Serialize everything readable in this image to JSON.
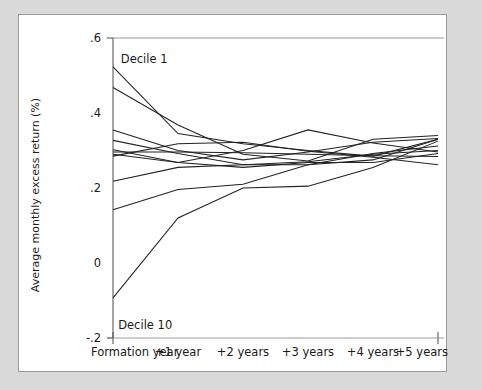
{
  "figure": {
    "background_color": "#d9d9d9",
    "panel_color": "#ffffff",
    "border_color": "#9a9a9a",
    "line_color": "#222222"
  },
  "chart_data": {
    "type": "line",
    "title": "",
    "subtitle": "",
    "xlabel": "",
    "ylabel": "Average monthly excess return (%)",
    "categories": [
      "Formation year",
      "+1 year",
      "+2 years",
      "+3 years",
      "+4 years",
      "+5 years"
    ],
    "x": [
      0,
      1,
      2,
      3,
      4,
      5
    ],
    "xlim": [
      0,
      5
    ],
    "ylim": [
      -0.2,
      0.6
    ],
    "yticks": [
      0.6,
      0.4,
      0.2,
      0,
      -0.2
    ],
    "ytick_labels": [
      ".6",
      ".4",
      ".2",
      "0",
      "-.2"
    ],
    "grid": false,
    "legend": "none",
    "annotations": [
      {
        "text": "Decile 1",
        "x": 0.12,
        "y": 0.545,
        "name": "decile-1-annotation"
      },
      {
        "text": "Decile 10",
        "x": 0.08,
        "y": -0.165,
        "name": "decile-10-annotation"
      }
    ],
    "series": [
      {
        "name": "Decile 1",
        "values": [
          0.523,
          0.345,
          0.318,
          0.3,
          0.285,
          0.33
        ]
      },
      {
        "name": "Decile 2",
        "values": [
          0.468,
          0.368,
          0.29,
          0.272,
          0.33,
          0.34
        ]
      },
      {
        "name": "Decile 3",
        "values": [
          0.355,
          0.3,
          0.275,
          0.296,
          0.322,
          0.332
        ]
      },
      {
        "name": "Decile 4",
        "values": [
          0.327,
          0.292,
          0.262,
          0.262,
          0.292,
          0.312
        ]
      },
      {
        "name": "Decile 5",
        "values": [
          0.302,
          0.268,
          0.255,
          0.268,
          0.268,
          0.292
        ]
      },
      {
        "name": "Decile 6",
        "values": [
          0.296,
          0.296,
          0.294,
          0.29,
          0.286,
          0.284
        ]
      },
      {
        "name": "Decile 7",
        "values": [
          0.29,
          0.268,
          0.3,
          0.355,
          0.32,
          0.296
        ]
      },
      {
        "name": "Decile 8",
        "values": [
          0.285,
          0.318,
          0.322,
          0.298,
          0.282,
          0.262
        ]
      },
      {
        "name": "Decile 9",
        "values": [
          0.218,
          0.255,
          0.262,
          0.27,
          0.29,
          0.3
        ]
      },
      {
        "name": "Decile 10",
        "values": [
          0.142,
          0.196,
          0.21,
          0.262,
          0.275,
          0.33
        ]
      },
      {
        "name": "Decile 11",
        "values": [
          -0.093,
          0.12,
          0.2,
          0.205,
          0.255,
          0.325
        ]
      }
    ]
  }
}
